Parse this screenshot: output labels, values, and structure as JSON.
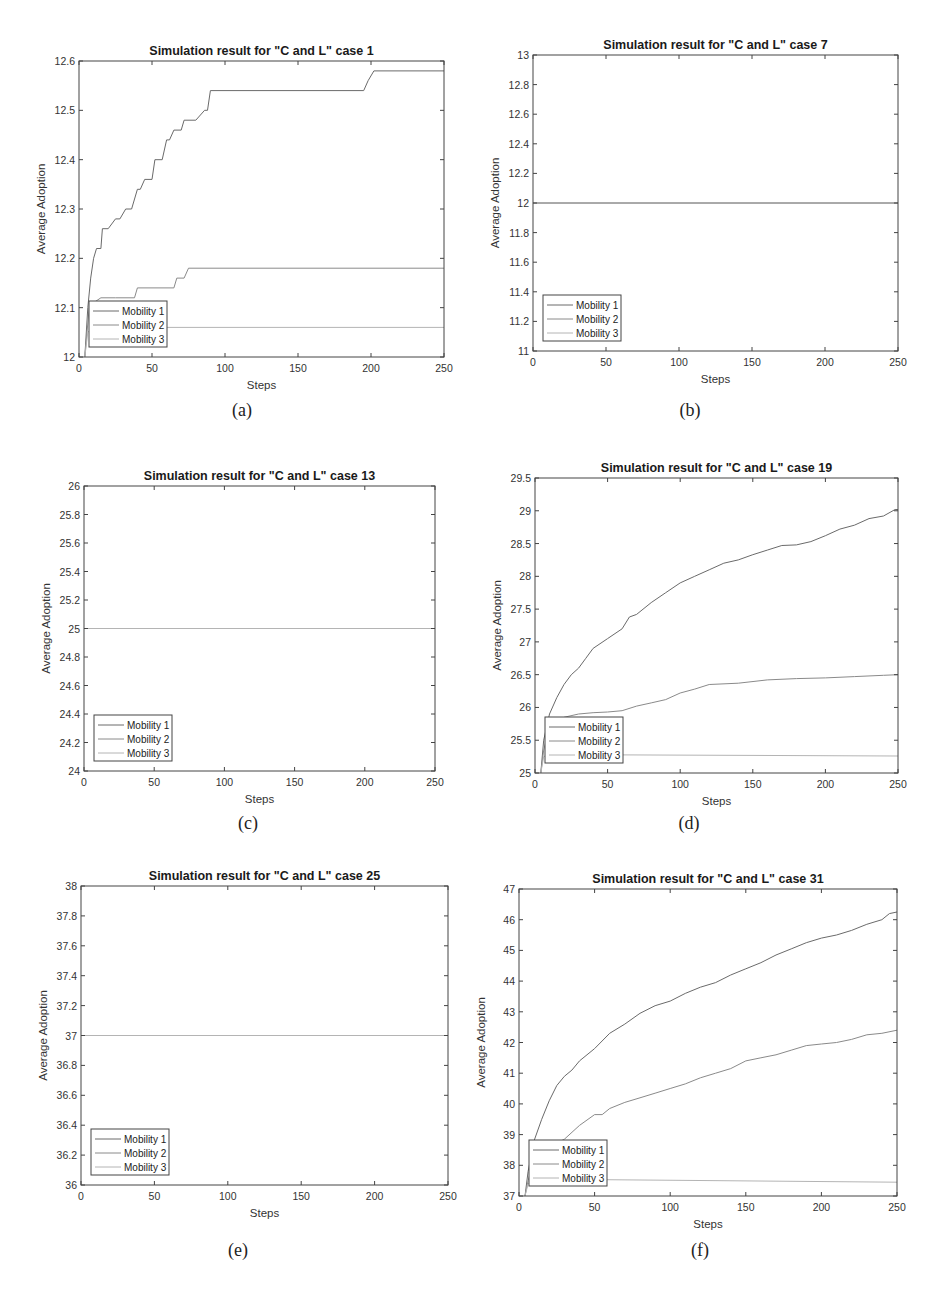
{
  "figure": {
    "subcaptions": [
      "(a)",
      "(b)",
      "(c)",
      "(d)",
      "(e)",
      "(f)"
    ]
  },
  "colors": {
    "mobility1": "#6a6a6a",
    "mobility2": "#8a8a8a",
    "mobility3": "#b4b4b4",
    "axis": "#444444"
  },
  "chart_data": [
    {
      "id": "a",
      "type": "line",
      "title": "Simulation result for \"C and L\" case 1",
      "xlabel": "Steps",
      "ylabel": "Average Adoption",
      "xlim": [
        0,
        250
      ],
      "ylim": [
        12,
        12.6
      ],
      "xticks": [
        0,
        50,
        100,
        150,
        200,
        250
      ],
      "yticks": [
        12,
        12.1,
        12.2,
        12.3,
        12.4,
        12.5,
        12.6
      ],
      "ytick_labels": [
        "12",
        "12.1",
        "12.2",
        "12.3",
        "12.4",
        "12.5",
        "12.6"
      ],
      "legend": {
        "position": "lower-left",
        "entries": [
          "Mobility 1",
          "Mobility 2",
          "Mobility 3"
        ]
      },
      "grid": false,
      "series": [
        {
          "name": "Mobility 1",
          "x": [
            4,
            6,
            8,
            10,
            12,
            15,
            16,
            20,
            25,
            28,
            32,
            36,
            40,
            42,
            45,
            50,
            52,
            57,
            60,
            62,
            65,
            70,
            72,
            80,
            86,
            88,
            90,
            195,
            198,
            202,
            250
          ],
          "y": [
            12,
            12.1,
            12.16,
            12.2,
            12.22,
            12.22,
            12.26,
            12.26,
            12.28,
            12.28,
            12.3,
            12.3,
            12.34,
            12.34,
            12.36,
            12.36,
            12.4,
            12.4,
            12.44,
            12.44,
            12.46,
            12.46,
            12.48,
            12.48,
            12.5,
            12.5,
            12.54,
            12.54,
            12.56,
            12.58,
            12.58
          ]
        },
        {
          "name": "Mobility 2",
          "x": [
            4,
            7,
            10,
            15,
            25,
            38,
            40,
            65,
            67,
            72,
            75,
            250
          ],
          "y": [
            12,
            12.1,
            12.11,
            12.12,
            12.12,
            12.12,
            12.14,
            12.14,
            12.16,
            12.16,
            12.18,
            12.18
          ]
        },
        {
          "name": "Mobility 3",
          "x": [
            4,
            6,
            10,
            250
          ],
          "y": [
            12,
            12.05,
            12.06,
            12.06
          ]
        }
      ]
    },
    {
      "id": "b",
      "type": "line",
      "title": "Simulation result for \"C and L\" case 7",
      "xlabel": "Steps",
      "ylabel": "Average Adoption",
      "xlim": [
        0,
        250
      ],
      "ylim": [
        11,
        13
      ],
      "xticks": [
        0,
        50,
        100,
        150,
        200,
        250
      ],
      "yticks": [
        11,
        11.2,
        11.4,
        11.6,
        11.8,
        12,
        12.2,
        12.4,
        12.6,
        12.8,
        13
      ],
      "ytick_labels": [
        "11",
        "11.2",
        "11.4",
        "11.6",
        "11.8",
        "12",
        "12.2",
        "12.4",
        "12.6",
        "12.8",
        "13"
      ],
      "legend": {
        "position": "lower-left",
        "entries": [
          "Mobility 1",
          "Mobility 2",
          "Mobility 3"
        ]
      },
      "grid": false,
      "series": [
        {
          "name": "Mobility 1",
          "x": [
            0,
            250
          ],
          "y": [
            12,
            12
          ]
        },
        {
          "name": "Mobility 2",
          "x": [
            0,
            250
          ],
          "y": [
            12,
            12
          ]
        },
        {
          "name": "Mobility 3",
          "x": [
            0,
            250
          ],
          "y": [
            12,
            12
          ]
        }
      ]
    },
    {
      "id": "c",
      "type": "line",
      "title": "Simulation result for \"C and L\" case 13",
      "xlabel": "Steps",
      "ylabel": "Average Adoption",
      "xlim": [
        0,
        250
      ],
      "ylim": [
        24,
        26
      ],
      "xticks": [
        0,
        50,
        100,
        150,
        200,
        250
      ],
      "yticks": [
        24,
        24.2,
        24.4,
        24.6,
        24.8,
        25,
        25.2,
        25.4,
        25.6,
        25.8,
        26
      ],
      "ytick_labels": [
        "24",
        "24.2",
        "24.4",
        "24.6",
        "24.8",
        "25",
        "25.2",
        "25.4",
        "25.6",
        "25.8",
        "26"
      ],
      "legend": {
        "position": "lower-left",
        "entries": [
          "Mobility 1",
          "Mobility 2",
          "Mobility 3"
        ]
      },
      "grid": false,
      "series": [
        {
          "name": "Mobility 1",
          "x": [
            0,
            250
          ],
          "y": [
            25,
            25
          ]
        },
        {
          "name": "Mobility 2",
          "x": [
            0,
            250
          ],
          "y": [
            25,
            25
          ]
        },
        {
          "name": "Mobility 3",
          "x": [
            0,
            250
          ],
          "y": [
            25,
            25
          ]
        }
      ]
    },
    {
      "id": "d",
      "type": "line",
      "title": "Simulation result for \"C and L\" case 19",
      "xlabel": "Steps",
      "ylabel": "Average Adoption",
      "xlim": [
        0,
        250
      ],
      "ylim": [
        25,
        29.5
      ],
      "xticks": [
        0,
        50,
        100,
        150,
        200,
        250
      ],
      "yticks": [
        25,
        25.5,
        26,
        26.5,
        27,
        27.5,
        28,
        28.5,
        29,
        29.5
      ],
      "ytick_labels": [
        "25",
        "25.5",
        "26",
        "26.5",
        "27",
        "27.5",
        "28",
        "28.5",
        "29",
        "29.5"
      ],
      "legend": {
        "position": "lower-left",
        "entries": [
          "Mobility 1",
          "Mobility 2",
          "Mobility 3"
        ]
      },
      "grid": false,
      "series": [
        {
          "name": "Mobility 1",
          "x": [
            4,
            6,
            10,
            15,
            20,
            25,
            30,
            35,
            40,
            50,
            60,
            65,
            70,
            80,
            90,
            100,
            110,
            120,
            130,
            140,
            150,
            160,
            170,
            180,
            190,
            200,
            210,
            220,
            230,
            240,
            248,
            250
          ],
          "y": [
            25,
            25.5,
            25.9,
            26.15,
            26.35,
            26.5,
            26.6,
            26.75,
            26.9,
            27.05,
            27.2,
            27.38,
            27.42,
            27.6,
            27.75,
            27.9,
            28.0,
            28.1,
            28.2,
            28.25,
            28.33,
            28.4,
            28.47,
            28.48,
            28.53,
            28.62,
            28.72,
            28.78,
            28.88,
            28.92,
            29.02,
            29.02
          ]
        },
        {
          "name": "Mobility 2",
          "x": [
            4,
            6,
            10,
            20,
            30,
            40,
            50,
            60,
            70,
            80,
            90,
            100,
            110,
            120,
            140,
            160,
            180,
            200,
            220,
            240,
            250
          ],
          "y": [
            25,
            25.35,
            25.7,
            25.85,
            25.9,
            25.92,
            25.93,
            25.95,
            26.02,
            26.07,
            26.12,
            26.22,
            26.28,
            26.35,
            26.37,
            26.42,
            26.44,
            26.45,
            26.47,
            26.49,
            26.5
          ]
        },
        {
          "name": "Mobility 3",
          "x": [
            4,
            6,
            10,
            250
          ],
          "y": [
            25,
            25.25,
            25.28,
            25.26
          ]
        }
      ]
    },
    {
      "id": "e",
      "type": "line",
      "title": "Simulation result for \"C and L\" case  25",
      "xlabel": "Steps",
      "ylabel": "Average Adoption",
      "xlim": [
        0,
        250
      ],
      "ylim": [
        36,
        38
      ],
      "xticks": [
        0,
        50,
        100,
        150,
        200,
        250
      ],
      "yticks": [
        36,
        36.2,
        36.4,
        36.6,
        36.8,
        37,
        37.2,
        37.4,
        37.6,
        37.8,
        38
      ],
      "ytick_labels": [
        "36",
        "36.2",
        "36.4",
        "36.6",
        "36.8",
        "37",
        "37.2",
        "37.4",
        "37.6",
        "37.8",
        "38"
      ],
      "legend": {
        "position": "lower-left",
        "entries": [
          "Mobility 1",
          "Mobility 2",
          "Mobility 3"
        ]
      },
      "grid": false,
      "series": [
        {
          "name": "Mobility 1",
          "x": [
            0,
            250
          ],
          "y": [
            37,
            37
          ]
        },
        {
          "name": "Mobility 2",
          "x": [
            0,
            250
          ],
          "y": [
            37,
            37
          ]
        },
        {
          "name": "Mobility 3",
          "x": [
            0,
            250
          ],
          "y": [
            37,
            37
          ]
        }
      ]
    },
    {
      "id": "f",
      "type": "line",
      "title": "Simulation result for \"C and L\" case 31",
      "xlabel": "Steps",
      "ylabel": "Average Adoption",
      "xlim": [
        0,
        250
      ],
      "ylim": [
        37,
        47
      ],
      "xticks": [
        0,
        50,
        100,
        150,
        200,
        250
      ],
      "yticks": [
        37,
        38,
        39,
        40,
        41,
        42,
        43,
        44,
        45,
        46,
        47
      ],
      "ytick_labels": [
        "37",
        "38",
        "39",
        "40",
        "41",
        "42",
        "43",
        "44",
        "45",
        "46",
        "47"
      ],
      "legend": {
        "position": "lower-left",
        "entries": [
          "Mobility 1",
          "Mobility 2",
          "Mobility 3"
        ]
      },
      "grid": false,
      "series": [
        {
          "name": "Mobility 1",
          "x": [
            4,
            6,
            10,
            15,
            20,
            25,
            30,
            35,
            40,
            50,
            60,
            70,
            80,
            90,
            100,
            110,
            120,
            130,
            140,
            150,
            160,
            170,
            180,
            190,
            200,
            210,
            220,
            230,
            240,
            245,
            250
          ],
          "y": [
            37,
            37.8,
            38.8,
            39.5,
            40.1,
            40.6,
            40.9,
            41.1,
            41.4,
            41.8,
            42.3,
            42.6,
            42.95,
            43.2,
            43.35,
            43.6,
            43.8,
            43.95,
            44.2,
            44.4,
            44.6,
            44.85,
            45.05,
            45.25,
            45.4,
            45.5,
            45.65,
            45.85,
            46.0,
            46.2,
            46.25
          ]
        },
        {
          "name": "Mobility 2",
          "x": [
            4,
            6,
            10,
            20,
            30,
            40,
            50,
            55,
            60,
            70,
            80,
            90,
            100,
            110,
            120,
            130,
            140,
            150,
            160,
            170,
            180,
            190,
            200,
            210,
            220,
            230,
            240,
            250
          ],
          "y": [
            37,
            37.5,
            38.2,
            38.6,
            38.85,
            39.3,
            39.65,
            39.65,
            39.85,
            40.05,
            40.2,
            40.35,
            40.5,
            40.65,
            40.85,
            41.0,
            41.15,
            41.4,
            41.5,
            41.6,
            41.75,
            41.9,
            41.95,
            42.0,
            42.1,
            42.25,
            42.3,
            42.4
          ]
        },
        {
          "name": "Mobility 3",
          "x": [
            4,
            6,
            10,
            250
          ],
          "y": [
            37,
            37.4,
            37.55,
            37.45
          ]
        }
      ]
    }
  ]
}
